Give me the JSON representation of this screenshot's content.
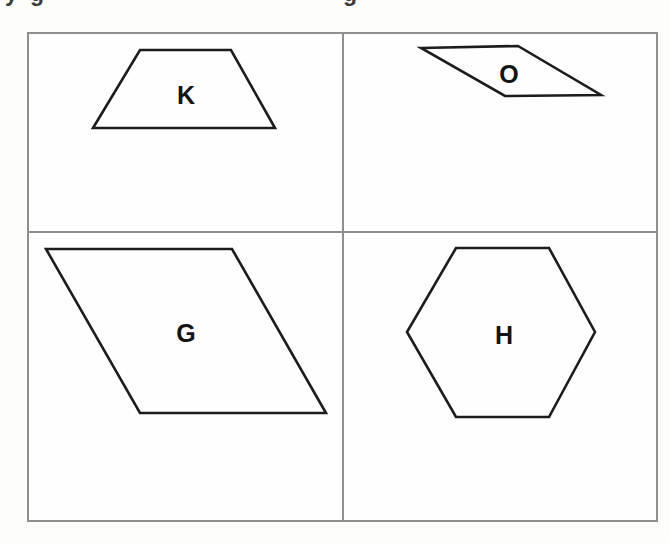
{
  "page": {
    "background_color": "#fdfdfc",
    "cropped_text_line": {
      "note": "only descender tails of a cut-off text line are visible at the very top",
      "glyphs": [
        {
          "char": "y"
        },
        {
          "char": "g"
        },
        {
          "char": "g"
        }
      ]
    }
  },
  "grid": {
    "rows": 2,
    "cols": 2,
    "border_color": "#8f8f8f",
    "cell_background": "#fefefe"
  },
  "shapes": [
    {
      "label": "K",
      "type": "trapezoid",
      "cell": "top-left",
      "points": "140,50 231,50 275,128 93,128"
    },
    {
      "label": "O",
      "type": "parallelogram",
      "cell": "top-right",
      "points": "421,48 518,46 601,95 505,96"
    },
    {
      "label": "G",
      "type": "parallelogram",
      "cell": "bottom-left",
      "points": "46,249 232,249 326,413 140,413"
    },
    {
      "label": "H",
      "type": "hexagon",
      "cell": "bottom-right",
      "points": "456,248 549,248 595,332 549,417 456,417 407,332"
    }
  ],
  "colors": {
    "shape_stroke": "#1c1c1c",
    "grid_line": "#8f8f8f",
    "label_text": "#141414"
  }
}
